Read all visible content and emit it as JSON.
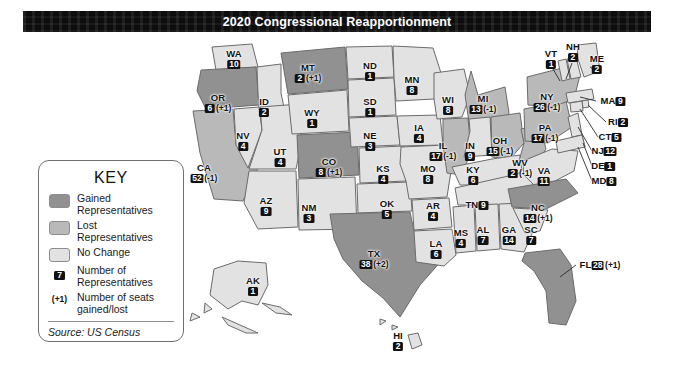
{
  "title": "2020 Congressional Reapportionment",
  "key": {
    "heading": "KEY",
    "items": [
      {
        "type": "swatch",
        "color": "#919191",
        "label": "Gained\nRepresentatives",
        "label_line1": "Gained",
        "label_line2": "Representatives"
      },
      {
        "type": "swatch",
        "color": "#b9b9b9",
        "label": "Lost\nRepresentatives",
        "label_line1": "Lost",
        "label_line2": "Representatives"
      },
      {
        "type": "swatch",
        "color": "#e2e2e2",
        "label": "No Change",
        "label_line1": "No Change",
        "label_line2": ""
      },
      {
        "type": "number-chip",
        "sample": "7",
        "label_line1": "Number of",
        "label_line2": "Representatives"
      },
      {
        "type": "paren",
        "sample": "(+1)",
        "label_line1": "Number of seats",
        "label_line2": "gained/lost"
      }
    ],
    "source": "Source: US Census"
  },
  "colors": {
    "gained": "#919191",
    "lost": "#b9b9b9",
    "no_change": "#e2e2e2",
    "outline": "#6b6b6b",
    "banner": "#0d0d0d",
    "banner_text": "#ffffff",
    "chip_bg": "#111111",
    "chip_text": "#ffffff"
  },
  "chart_data": {
    "type": "map",
    "title": "2020 Congressional Reapportionment",
    "legend_position": "left",
    "categories": [
      "Gained Representatives",
      "Lost Representatives",
      "No Change"
    ],
    "source": "Source: US Census",
    "states": [
      {
        "abbr": "WA",
        "seats": 10,
        "delta": "",
        "status": "no_change",
        "x": 234,
        "y": 26,
        "layout": "stack"
      },
      {
        "abbr": "OR",
        "seats": 6,
        "delta": "(+1)",
        "status": "gained",
        "x": 218,
        "y": 70,
        "layout": "stack"
      },
      {
        "abbr": "CA",
        "seats": 52,
        "delta": "(-1)",
        "status": "lost",
        "x": 204,
        "y": 140,
        "layout": "stack"
      },
      {
        "abbr": "ID",
        "seats": 2,
        "delta": "",
        "status": "no_change",
        "x": 264,
        "y": 74,
        "layout": "stack"
      },
      {
        "abbr": "NV",
        "seats": 4,
        "delta": "",
        "status": "no_change",
        "x": 243,
        "y": 108,
        "layout": "stack"
      },
      {
        "abbr": "UT",
        "seats": 4,
        "delta": "",
        "status": "no_change",
        "x": 280,
        "y": 124,
        "layout": "stack"
      },
      {
        "abbr": "AZ",
        "seats": 9,
        "delta": "",
        "status": "no_change",
        "x": 266,
        "y": 173,
        "layout": "stack"
      },
      {
        "abbr": "MT",
        "seats": 2,
        "delta": "(+1)",
        "status": "gained",
        "x": 308,
        "y": 40,
        "layout": "stack"
      },
      {
        "abbr": "WY",
        "seats": 1,
        "delta": "",
        "status": "no_change",
        "x": 312,
        "y": 85,
        "layout": "stack"
      },
      {
        "abbr": "CO",
        "seats": 8,
        "delta": "(+1)",
        "status": "gained",
        "x": 329,
        "y": 134,
        "layout": "stack"
      },
      {
        "abbr": "NM",
        "seats": 3,
        "delta": "",
        "status": "no_change",
        "x": 309,
        "y": 180,
        "layout": "stack"
      },
      {
        "abbr": "ND",
        "seats": 1,
        "delta": "",
        "status": "no_change",
        "x": 370,
        "y": 38,
        "layout": "stack"
      },
      {
        "abbr": "SD",
        "seats": 1,
        "delta": "",
        "status": "no_change",
        "x": 370,
        "y": 74,
        "layout": "stack"
      },
      {
        "abbr": "NE",
        "seats": 3,
        "delta": "",
        "status": "no_change",
        "x": 370,
        "y": 108,
        "layout": "stack"
      },
      {
        "abbr": "KS",
        "seats": 4,
        "delta": "",
        "status": "no_change",
        "x": 383,
        "y": 141,
        "layout": "stack"
      },
      {
        "abbr": "OK",
        "seats": 5,
        "delta": "",
        "status": "no_change",
        "x": 387,
        "y": 176,
        "layout": "stack"
      },
      {
        "abbr": "TX",
        "seats": 38,
        "delta": "(+2)",
        "status": "gained",
        "x": 374,
        "y": 226,
        "layout": "stack"
      },
      {
        "abbr": "MN",
        "seats": 8,
        "delta": "",
        "status": "no_change",
        "x": 412,
        "y": 52,
        "layout": "stack"
      },
      {
        "abbr": "IA",
        "seats": 4,
        "delta": "",
        "status": "no_change",
        "x": 419,
        "y": 100,
        "layout": "stack"
      },
      {
        "abbr": "MO",
        "seats": 8,
        "delta": "",
        "status": "no_change",
        "x": 428,
        "y": 141,
        "layout": "stack"
      },
      {
        "abbr": "AR",
        "seats": 4,
        "delta": "",
        "status": "no_change",
        "x": 433,
        "y": 178,
        "layout": "stack"
      },
      {
        "abbr": "LA",
        "seats": 6,
        "delta": "",
        "status": "no_change",
        "x": 436,
        "y": 216,
        "layout": "stack"
      },
      {
        "abbr": "WI",
        "seats": 8,
        "delta": "",
        "status": "no_change",
        "x": 448,
        "y": 72,
        "layout": "stack"
      },
      {
        "abbr": "IL",
        "seats": 17,
        "delta": "(-1)",
        "status": "lost",
        "x": 443,
        "y": 118,
        "layout": "stack"
      },
      {
        "abbr": "MI",
        "seats": 13,
        "delta": "(-1)",
        "status": "lost",
        "x": 483,
        "y": 71,
        "layout": "stack"
      },
      {
        "abbr": "IN",
        "seats": 9,
        "delta": "",
        "status": "no_change",
        "x": 470,
        "y": 118,
        "layout": "stack"
      },
      {
        "abbr": "OH",
        "seats": 15,
        "delta": "(-1)",
        "status": "lost",
        "x": 500,
        "y": 113,
        "layout": "stack"
      },
      {
        "abbr": "KY",
        "seats": 6,
        "delta": "",
        "status": "no_change",
        "x": 473,
        "y": 142,
        "layout": "stack"
      },
      {
        "abbr": "WV",
        "seats": 2,
        "delta": "(-1)",
        "status": "lost",
        "x": 520,
        "y": 135,
        "layout": "stack"
      },
      {
        "abbr": "VA",
        "seats": 11,
        "delta": "",
        "status": "no_change",
        "x": 544,
        "y": 143,
        "layout": "stack"
      },
      {
        "abbr": "TN",
        "seats": 9,
        "delta": "",
        "status": "no_change",
        "x": 477,
        "y": 172,
        "layout": "inline"
      },
      {
        "abbr": "MS",
        "seats": 4,
        "delta": "",
        "status": "no_change",
        "x": 461,
        "y": 205,
        "layout": "stack"
      },
      {
        "abbr": "AL",
        "seats": 7,
        "delta": "",
        "status": "no_change",
        "x": 483,
        "y": 202,
        "layout": "stack"
      },
      {
        "abbr": "GA",
        "seats": 14,
        "delta": "",
        "status": "no_change",
        "x": 509,
        "y": 202,
        "layout": "stack"
      },
      {
        "abbr": "NC",
        "seats": 14,
        "delta": "(+1)",
        "status": "gained",
        "x": 538,
        "y": 180,
        "layout": "stack"
      },
      {
        "abbr": "SC",
        "seats": 7,
        "delta": "",
        "status": "no_change",
        "x": 531,
        "y": 202,
        "layout": "stack"
      },
      {
        "abbr": "FL",
        "seats": 28,
        "delta": "(+1)",
        "status": "gained",
        "x": 600,
        "y": 232,
        "layout": "inline"
      },
      {
        "abbr": "PA",
        "seats": 17,
        "delta": "(-1)",
        "status": "lost",
        "x": 545,
        "y": 100,
        "layout": "stack"
      },
      {
        "abbr": "NY",
        "seats": 26,
        "delta": "(-1)",
        "status": "lost",
        "x": 547,
        "y": 69,
        "layout": "stack"
      },
      {
        "abbr": "VT",
        "seats": 1,
        "delta": "",
        "status": "no_change",
        "x": 551,
        "y": 26,
        "layout": "stack"
      },
      {
        "abbr": "NH",
        "seats": 2,
        "delta": "",
        "status": "no_change",
        "x": 573,
        "y": 19,
        "layout": "stack"
      },
      {
        "abbr": "ME",
        "seats": 2,
        "delta": "",
        "status": "no_change",
        "x": 597,
        "y": 31,
        "layout": "stack"
      },
      {
        "abbr": "MA",
        "seats": 9,
        "delta": "",
        "status": "no_change",
        "x": 613,
        "y": 68,
        "layout": "inline"
      },
      {
        "abbr": "RI",
        "seats": 2,
        "delta": "",
        "status": "no_change",
        "x": 618,
        "y": 89,
        "layout": "inline"
      },
      {
        "abbr": "CT",
        "seats": 5,
        "delta": "",
        "status": "no_change",
        "x": 610,
        "y": 104,
        "layout": "inline"
      },
      {
        "abbr": "NJ",
        "seats": 12,
        "delta": "",
        "status": "no_change",
        "x": 604,
        "y": 118,
        "layout": "inline"
      },
      {
        "abbr": "DE",
        "seats": 1,
        "delta": "",
        "status": "no_change",
        "x": 603,
        "y": 133,
        "layout": "inline"
      },
      {
        "abbr": "MD",
        "seats": 8,
        "delta": "",
        "status": "no_change",
        "x": 604,
        "y": 148,
        "layout": "inline"
      },
      {
        "abbr": "AK",
        "seats": 1,
        "delta": "",
        "status": "no_change",
        "x": 253,
        "y": 253,
        "layout": "stack"
      },
      {
        "abbr": "HI",
        "seats": 2,
        "delta": "",
        "status": "no_change",
        "x": 398,
        "y": 308,
        "layout": "stack"
      }
    ]
  }
}
